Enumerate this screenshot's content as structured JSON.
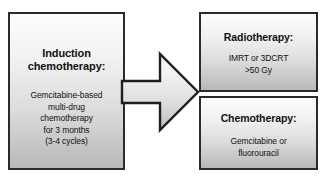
{
  "diagram": {
    "type": "flowchart",
    "colors": {
      "box_border": "#2b2b2b",
      "box_fill_top": "#fcfcfc",
      "box_fill_bottom": "#b8b8b8",
      "text": "#111111",
      "background": "#ffffff"
    }
  },
  "induction": {
    "heading_line1": "Induction",
    "heading_line2": "chemotherapy:",
    "body_line1": "Gemcitabine-based",
    "body_line2": "multi-drug",
    "body_line3": "chemotherapy",
    "body_line4": "for 3 months",
    "body_line5": "(3-4 cycles)"
  },
  "arrow": {
    "icon": "block-arrow-right-icon",
    "direction": "right"
  },
  "radiotherapy": {
    "heading": "Radiotherapy:",
    "body_line1": "IMRT or 3DCRT",
    "body_line2": ">50 Gy"
  },
  "chemotherapy": {
    "heading": "Chemotherapy:",
    "body_line1": "Gemcitabine or",
    "body_line2": "fluorouracil"
  }
}
